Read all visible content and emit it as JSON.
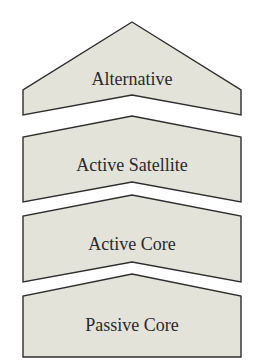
{
  "diagram": {
    "type": "stacked-chevron-layers",
    "colors": {
      "fill": "#e3e3da",
      "stroke": "#2e2e2e",
      "text": "#2a2a2a",
      "background": "#ffffff"
    },
    "layers": [
      {
        "label": "Alternative"
      },
      {
        "label": "Active Satellite"
      },
      {
        "label": "Active Core"
      },
      {
        "label": "Passive Core"
      }
    ]
  }
}
